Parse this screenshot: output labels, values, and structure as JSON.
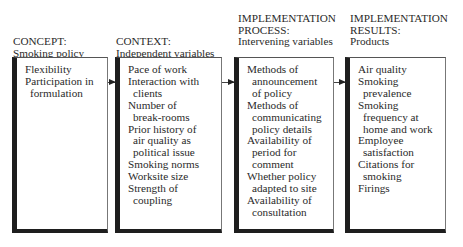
{
  "columns": [
    {
      "heading": [
        "CONCEPT:",
        "Smoking policy"
      ],
      "items": [
        [
          "Flexibility"
        ],
        [
          "Participation in",
          "formulation"
        ]
      ]
    },
    {
      "heading": [
        "CONTEXT:",
        "Independent variables"
      ],
      "items": [
        [
          "Pace of work"
        ],
        [
          "Interaction with",
          "clients"
        ],
        [
          "Number of",
          "break-rooms"
        ],
        [
          "Prior history of",
          "air quality as",
          "political issue"
        ],
        [
          "Smoking norms"
        ],
        [
          "Worksite size"
        ],
        [
          "Strength of",
          "coupling"
        ]
      ]
    },
    {
      "heading": [
        "IMPLEMENTATION",
        "PROCESS:",
        "Intervening variables"
      ],
      "items": [
        [
          "Methods of",
          "announcement",
          "of policy"
        ],
        [
          "Methods of",
          "communicating",
          "policy details"
        ],
        [
          "Availability of",
          "period for",
          "comment"
        ],
        [
          "Whether policy",
          "adapted to site"
        ],
        [
          "Availability of",
          "consultation"
        ]
      ]
    },
    {
      "heading": [
        "IMPLEMENTATION",
        "RESULTS:",
        "Products"
      ],
      "items": [
        [
          "Air quality"
        ],
        [
          "Smoking",
          "prevalence"
        ],
        [
          "Smoking",
          "frequency at",
          "home and work"
        ],
        [
          "Employee",
          "satisfaction"
        ],
        [
          "Citations for",
          "smoking"
        ],
        [
          "Firings"
        ]
      ]
    }
  ],
  "arrows": [
    {
      "from": "concept",
      "to": "context"
    },
    {
      "from": "context",
      "to": "implementation-process"
    },
    {
      "from": "implementation-process",
      "to": "implementation-results"
    }
  ]
}
